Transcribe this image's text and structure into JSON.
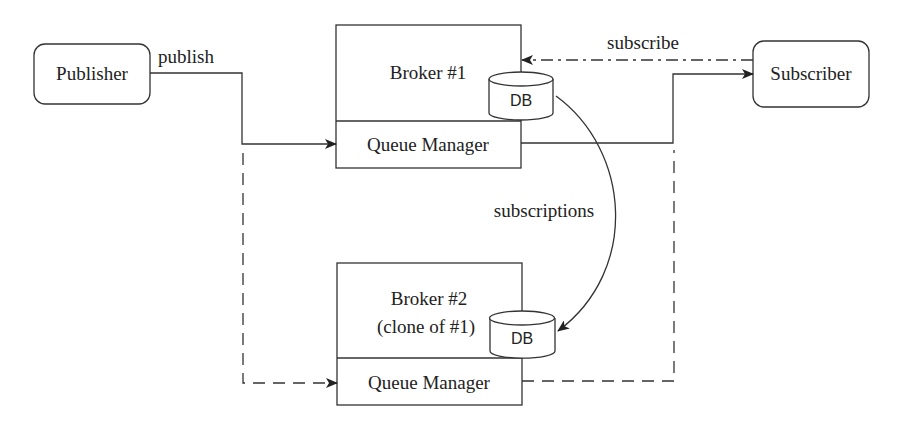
{
  "diagram": {
    "type": "publish-subscribe architecture",
    "nodes": {
      "publisher": {
        "label": "Publisher"
      },
      "subscriber": {
        "label": "Subscriber"
      },
      "broker1": {
        "title": "Broker #1",
        "queue_manager": "Queue Manager",
        "db": "DB"
      },
      "broker2": {
        "title_line1": "Broker #2",
        "title_line2": "(clone of #1)",
        "queue_manager": "Queue Manager",
        "db": "DB"
      }
    },
    "edges": {
      "publish": {
        "label": "publish",
        "style": "solid",
        "from": "Publisher",
        "to": "Broker #1 Queue Manager"
      },
      "subscribe": {
        "label": "subscribe",
        "style": "dash-dot",
        "from": "Subscriber",
        "to": "Broker #1"
      },
      "deliver": {
        "label": "",
        "style": "solid",
        "from": "Broker #1 Queue Manager",
        "to": "Subscriber"
      },
      "subscriptions": {
        "label": "subscriptions",
        "style": "curved solid",
        "from": "Broker #1 DB",
        "to": "Broker #2 DB"
      },
      "backup_publish": {
        "label": "",
        "style": "dashed",
        "from": "Publisher",
        "to": "Broker #2 Queue Manager"
      },
      "backup_deliver": {
        "label": "",
        "style": "dashed",
        "from": "Broker #2 Queue Manager",
        "to": "Subscriber"
      }
    }
  },
  "colors": {
    "line": "#333333",
    "text": "#222222",
    "background": "#ffffff"
  }
}
